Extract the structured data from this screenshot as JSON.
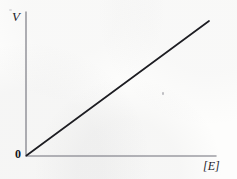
{
  "figure": {
    "background_color": "#fdfdfc",
    "width": 237,
    "height": 179
  },
  "chart_data": {
    "type": "line",
    "title": "",
    "subtitle": "",
    "xlabel": "[E]",
    "ylabel": "V",
    "origin_label": "0",
    "grid": false,
    "legend": null,
    "axis_color": "#6f6f78",
    "line_color": "#1d1d22",
    "xlim": [
      0,
      1
    ],
    "ylim": [
      0,
      1
    ],
    "xticks": [],
    "yticks": [],
    "xticklabels": [],
    "yticklabels": [],
    "annotations": [],
    "series": [
      {
        "name": "V vs [E]",
        "x": [
          0,
          1
        ],
        "y": [
          0,
          1
        ],
        "style": "solid",
        "description": "straight line through the origin with constant positive slope"
      }
    ]
  },
  "labels": {
    "y_axis": "V",
    "x_axis": "[E]",
    "origin": "0"
  }
}
